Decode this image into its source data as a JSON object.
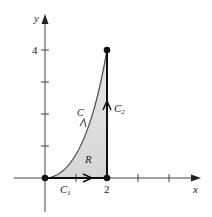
{
  "diagram": {
    "type": "region-boundary-plot",
    "axes": {
      "x_label": "x",
      "y_label": "y",
      "x_tick_label": "2",
      "y_tick_label": "4"
    },
    "curves": {
      "C": "C",
      "C1": "C",
      "C1_sub": "1",
      "C2": "C",
      "C2_sub": "2"
    },
    "region_label": "R",
    "points": [
      {
        "x": 0,
        "y": 0
      },
      {
        "x": 2,
        "y": 0
      },
      {
        "x": 2,
        "y": 4
      }
    ],
    "colors": {
      "region_fill": "#d9d9d9",
      "curve": "#333333",
      "axis": "#333333"
    }
  }
}
